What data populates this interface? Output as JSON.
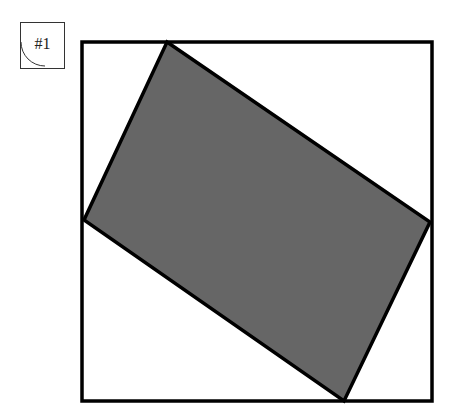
{
  "label": {
    "text": "#1"
  },
  "diagram": {
    "square": {
      "x1": 82,
      "y1": 42,
      "x2": 432,
      "y2": 401,
      "stroke": "#000000",
      "stroke_width": 3.5
    },
    "rectangle": {
      "points": [
        [
          167,
          42
        ],
        [
          430,
          222
        ],
        [
          344,
          401
        ],
        [
          84,
          220
        ]
      ],
      "fill": "#666666",
      "stroke": "#000000",
      "stroke_width": 3.5
    }
  }
}
